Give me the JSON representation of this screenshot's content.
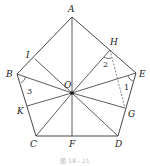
{
  "figure": {
    "caption": "图 18 - 21",
    "caption_note": "caption is faint; exact text not confirmed",
    "stroke_color": "#333333",
    "points": {
      "A": {
        "x": 72,
        "y": 17,
        "label": "A"
      },
      "B": {
        "x": 17,
        "y": 74,
        "label": "B"
      },
      "C": {
        "x": 36,
        "y": 136,
        "label": "C"
      },
      "D": {
        "x": 118,
        "y": 136,
        "label": "D"
      },
      "E": {
        "x": 136,
        "y": 73,
        "label": "E"
      },
      "O": {
        "x": 72,
        "y": 93,
        "label": "O"
      },
      "F": {
        "x": 72,
        "y": 136,
        "label": "F"
      },
      "H": {
        "x": 110,
        "y": 50,
        "label": "H"
      },
      "I": {
        "x": 35,
        "y": 59,
        "label": "I"
      },
      "K": {
        "x": 27,
        "y": 106,
        "label": "K"
      },
      "G": {
        "x": 125,
        "y": 108,
        "label": "G"
      }
    },
    "angles": [
      {
        "id": "1",
        "label": "1",
        "vertex": "E"
      },
      {
        "id": "2",
        "label": "2",
        "vertex": "H"
      },
      {
        "id": "3",
        "label": "3",
        "vertex": "B"
      }
    ],
    "dashed_segments": [
      [
        "H",
        "G"
      ]
    ]
  }
}
